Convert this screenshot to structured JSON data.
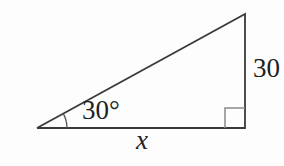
{
  "figure": {
    "type": "right-triangle-diagram",
    "angle_label": "30°",
    "vertical_side_label": "30",
    "base_label": "x",
    "line_color": "#3a3a3a",
    "marker_color": "#8a8a8a",
    "arc_color": "#555555",
    "text_color": "#1f1f1f",
    "background": "#fdfdfd"
  }
}
